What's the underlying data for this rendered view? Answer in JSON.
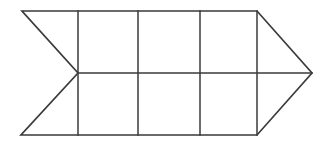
{
  "figure": {
    "background_color": "#ffffff",
    "stroke_color": "#3a3a3a",
    "stroke_width": 1.6,
    "canvas": {
      "width": 334,
      "height": 147
    },
    "outline_points": "22,11 257,11 312,73 257,135 21,135 78,73",
    "geometry": {
      "top_left": [
        22,
        11
      ],
      "top_right": [
        257,
        11
      ],
      "arrow_tip": [
        312,
        73
      ],
      "bottom_right": [
        257,
        135
      ],
      "bottom_left": [
        21,
        135
      ],
      "notch_vertex": [
        78,
        73
      ],
      "mid_y": 73,
      "top_y": 11,
      "bottom_y": 135,
      "vertical_x": [
        78,
        138,
        200,
        257
      ]
    },
    "mid_horizontal": {
      "x1": 78,
      "y1": 73,
      "x2": 312,
      "y2": 73
    },
    "verticals": [
      {
        "x": 78,
        "y1": 11,
        "y2": 135
      },
      {
        "x": 138,
        "y1": 11,
        "y2": 135
      },
      {
        "x": 200,
        "y1": 11,
        "y2": 135
      },
      {
        "x": 257,
        "y1": 11,
        "y2": 135
      }
    ],
    "counts": {
      "square_cells": 6,
      "rows": 2,
      "columns": 3,
      "triangles": 4
    }
  }
}
